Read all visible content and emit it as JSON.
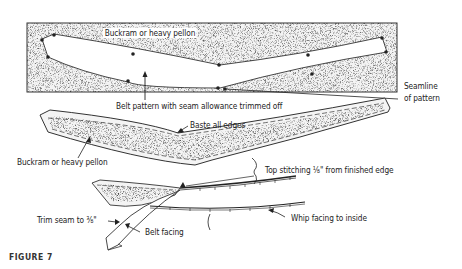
{
  "figure": {
    "caption": "FIGURE 7",
    "labels": {
      "top_buckram": "Buckram or heavy pellon",
      "belt_pattern": "Belt pattern with seam allowance trimmed off",
      "seamline_line1": "Seamline",
      "seamline_line2": "of pattern",
      "baste": "Baste all edges",
      "mid_buckram": "Buckram or heavy pellon",
      "top_stitching": "Top stitching ⅛\" from finished edge",
      "whip_facing": "Whip facing to inside",
      "trim_seam": "Trim seam to ⅜\"",
      "belt_facing": "Belt facing"
    },
    "colors": {
      "ink": "#222222",
      "paper": "#ffffff",
      "speckle": "#9a9a9a"
    }
  }
}
